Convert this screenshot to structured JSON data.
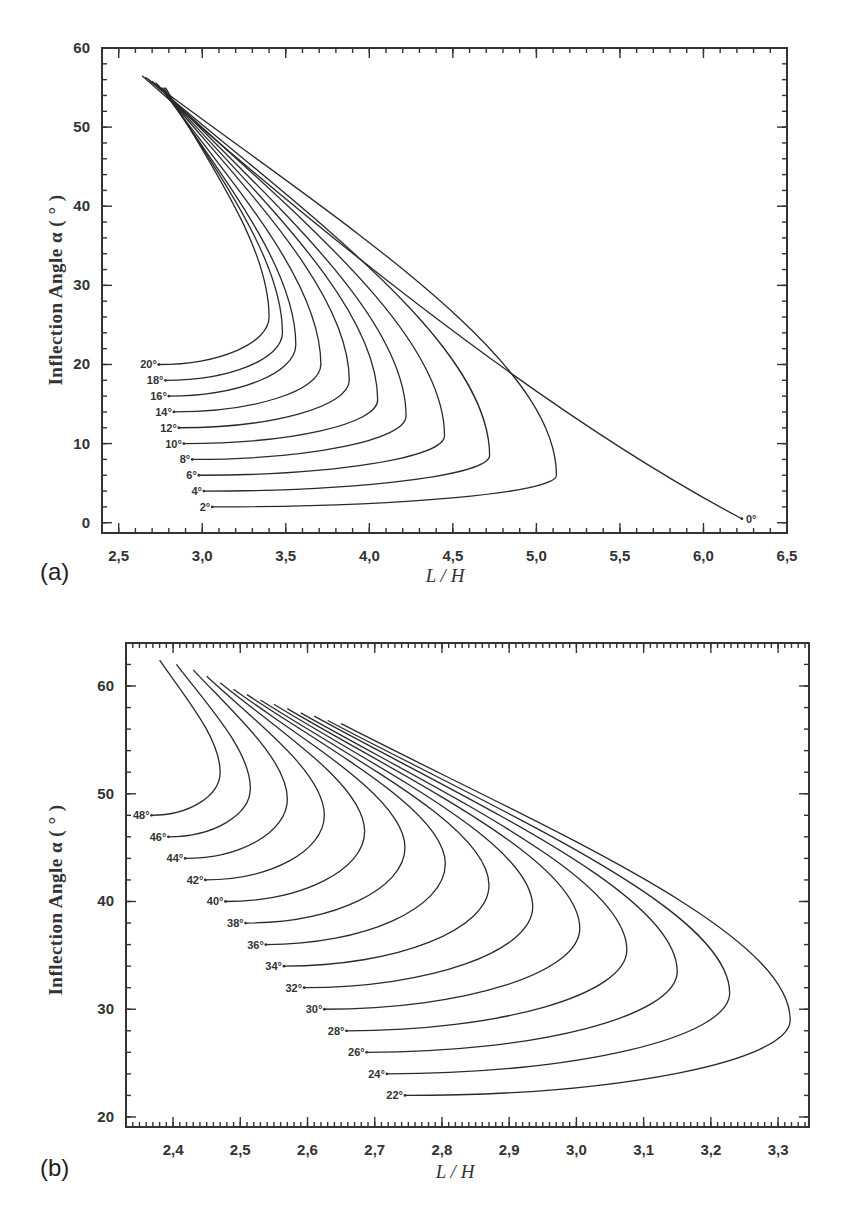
{
  "chart_data": [
    {
      "panel": "(a)",
      "type": "line",
      "title": "",
      "xlabel": "L / H",
      "ylabel": "Inflection Angle  α  ( ° )",
      "xlim": [
        2.4,
        6.5
      ],
      "ylim": [
        -1.3,
        60
      ],
      "xticks": [
        2.5,
        3.0,
        3.5,
        4.0,
        4.5,
        5.0,
        5.5,
        6.0,
        6.5
      ],
      "xtick_labels": [
        "2,5",
        "3,0",
        "3,5",
        "4,0",
        "4,5",
        "5,0",
        "5,5",
        "6,0",
        "6,5"
      ],
      "yticks": [
        0,
        10,
        20,
        30,
        40,
        50,
        60
      ],
      "ytick_labels": [
        "0",
        "10",
        "20",
        "30",
        "40",
        "50",
        "60"
      ],
      "grid": false,
      "legend": "inline curve labels at left end of each curve",
      "series": [
        {
          "name": "0°",
          "start": [
            6.23,
            0.5
          ],
          "nose": [
            6.23,
            0.5
          ],
          "top": [
            2.64,
            56.5
          ]
        },
        {
          "name": "2°",
          "start": [
            3.06,
            2.0
          ],
          "nose": [
            5.12,
            6.0
          ],
          "top": [
            2.66,
            56.3
          ]
        },
        {
          "name": "4°",
          "start": [
            3.01,
            4.0
          ],
          "nose": [
            4.72,
            8.5
          ],
          "top": [
            2.68,
            56.0
          ]
        },
        {
          "name": "6°",
          "start": [
            2.98,
            6.0
          ],
          "nose": [
            4.45,
            11.0
          ],
          "top": [
            2.7,
            55.8
          ]
        },
        {
          "name": "8°",
          "start": [
            2.94,
            8.0
          ],
          "nose": [
            4.22,
            13.5
          ],
          "top": [
            2.72,
            55.6
          ]
        },
        {
          "name": "10°",
          "start": [
            2.89,
            10.0
          ],
          "nose": [
            4.05,
            15.5
          ],
          "top": [
            2.73,
            55.4
          ]
        },
        {
          "name": "12°",
          "start": [
            2.86,
            12.0
          ],
          "nose": [
            3.88,
            18.0
          ],
          "top": [
            2.74,
            55.2
          ]
        },
        {
          "name": "14°",
          "start": [
            2.83,
            14.0
          ],
          "nose": [
            3.71,
            20.0
          ],
          "top": [
            2.75,
            55.0
          ]
        },
        {
          "name": "16°",
          "start": [
            2.8,
            16.0
          ],
          "nose": [
            3.56,
            22.5
          ],
          "top": [
            2.76,
            55.0
          ]
        },
        {
          "name": "18°",
          "start": [
            2.78,
            18.0
          ],
          "nose": [
            3.48,
            24.0
          ],
          "top": [
            2.77,
            55.0
          ]
        },
        {
          "name": "20°",
          "start": [
            2.74,
            20.0
          ],
          "nose": [
            3.4,
            26.0
          ],
          "top": [
            2.78,
            55.0
          ]
        }
      ]
    },
    {
      "panel": "(b)",
      "type": "line",
      "title": "",
      "xlabel": "L / H",
      "ylabel": "Inflection Angle  α  ( ° )",
      "xlim": [
        2.33,
        3.346
      ],
      "ylim": [
        19.07,
        63.99
      ],
      "xticks": [
        2.4,
        2.5,
        2.6,
        2.7,
        2.8,
        2.9,
        3.0,
        3.1,
        3.2,
        3.3
      ],
      "xtick_labels": [
        "2,4",
        "2,5",
        "2,6",
        "2,7",
        "2,8",
        "2,9",
        "3,0",
        "3,1",
        "3,2",
        "3,3"
      ],
      "yticks": [
        20,
        30,
        40,
        50,
        60
      ],
      "ytick_labels": [
        "20",
        "30",
        "40",
        "50",
        "60"
      ],
      "grid": false,
      "legend": "inline curve labels at left end of each curve",
      "series": [
        {
          "name": "22°",
          "start": [
            2.745,
            22.0
          ],
          "nose": [
            3.318,
            29.0
          ],
          "top": [
            2.65,
            56.5
          ]
        },
        {
          "name": "24°",
          "start": [
            2.718,
            24.0
          ],
          "nose": [
            3.228,
            31.5
          ],
          "top": [
            2.63,
            56.8
          ]
        },
        {
          "name": "26°",
          "start": [
            2.688,
            26.0
          ],
          "nose": [
            3.15,
            33.5
          ],
          "top": [
            2.61,
            57.2
          ]
        },
        {
          "name": "28°",
          "start": [
            2.658,
            28.0
          ],
          "nose": [
            3.075,
            35.5
          ],
          "top": [
            2.59,
            57.5
          ]
        },
        {
          "name": "30°",
          "start": [
            2.625,
            30.0
          ],
          "nose": [
            3.005,
            37.5
          ],
          "top": [
            2.57,
            57.9
          ]
        },
        {
          "name": "32°",
          "start": [
            2.595,
            32.0
          ],
          "nose": [
            2.935,
            39.5
          ],
          "top": [
            2.55,
            58.3
          ]
        },
        {
          "name": "34°",
          "start": [
            2.565,
            34.0
          ],
          "nose": [
            2.87,
            41.5
          ],
          "top": [
            2.53,
            58.7
          ]
        },
        {
          "name": "36°",
          "start": [
            2.538,
            36.0
          ],
          "nose": [
            2.805,
            43.5
          ],
          "top": [
            2.51,
            59.2
          ]
        },
        {
          "name": "38°",
          "start": [
            2.508,
            38.0
          ],
          "nose": [
            2.745,
            45.0
          ],
          "top": [
            2.49,
            59.7
          ]
        },
        {
          "name": "40°",
          "start": [
            2.478,
            40.0
          ],
          "nose": [
            2.685,
            46.5
          ],
          "top": [
            2.47,
            60.3
          ]
        },
        {
          "name": "42°",
          "start": [
            2.448,
            42.0
          ],
          "nose": [
            2.625,
            48.0
          ],
          "top": [
            2.45,
            60.9
          ]
        },
        {
          "name": "44°",
          "start": [
            2.418,
            44.0
          ],
          "nose": [
            2.57,
            49.5
          ],
          "top": [
            2.43,
            61.5
          ]
        },
        {
          "name": "46°",
          "start": [
            2.393,
            46.0
          ],
          "nose": [
            2.515,
            50.5
          ],
          "top": [
            2.405,
            62.0
          ]
        },
        {
          "name": "48°",
          "start": [
            2.368,
            48.0
          ],
          "nose": [
            2.47,
            52.0
          ],
          "top": [
            2.38,
            62.4
          ]
        }
      ]
    }
  ],
  "figure": {
    "panel_a_label": "(a)",
    "panel_b_label": "(b)",
    "xlabel_a": "L / H",
    "xlabel_b": "L / H",
    "ylabel_a": "Inflection Angle  α  ( ° )",
    "ylabel_b": "Inflection Angle  α  ( ° )"
  }
}
